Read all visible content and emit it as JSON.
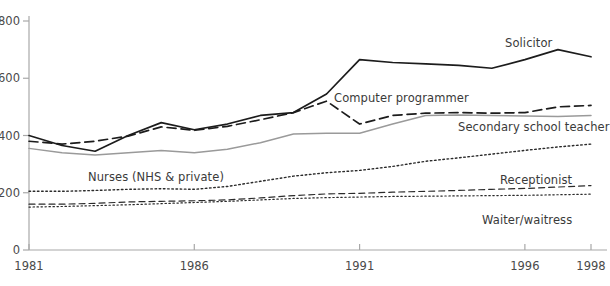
{
  "chart_data": {
    "type": "line",
    "title": "",
    "xlabel": "",
    "ylabel": "",
    "xlim": [
      1981,
      1998
    ],
    "ylim": [
      0,
      800
    ],
    "grid": false,
    "legend_position": "inline-labels",
    "x": [
      1981,
      1982,
      1983,
      1984,
      1985,
      1986,
      1987,
      1988,
      1989,
      1990,
      1991,
      1992,
      1993,
      1994,
      1995,
      1996,
      1997,
      1998
    ],
    "xticks": [
      1981,
      1986,
      1991,
      1996,
      1998
    ],
    "xtick_labels": [
      "1981",
      "1986",
      "1991",
      "1996",
      "1998"
    ],
    "yticks": [
      0,
      200,
      400,
      600,
      800
    ],
    "ytick_labels": [
      "0",
      "200",
      "400",
      "600",
      "800"
    ],
    "series": [
      {
        "name": "Solicitor",
        "style": "solid",
        "color": "#1c1c1c",
        "width": 1.7,
        "label_x": 505,
        "label_y": 36,
        "values": [
          400,
          365,
          345,
          400,
          445,
          420,
          440,
          470,
          480,
          545,
          665,
          655,
          650,
          645,
          635,
          665,
          700,
          675
        ]
      },
      {
        "name": "Computer programmer",
        "style": "dashed",
        "color": "#1c1c1c",
        "width": 1.7,
        "label_x": 334,
        "label_y": 91,
        "values": [
          380,
          370,
          380,
          398,
          430,
          418,
          432,
          455,
          480,
          520,
          440,
          470,
          478,
          480,
          478,
          480,
          500,
          505
        ]
      },
      {
        "name": "Secondary school teacher",
        "style": "solid",
        "color": "#9a9a9a",
        "width": 1.5,
        "label_x": 458,
        "label_y": 120,
        "values": [
          355,
          340,
          332,
          340,
          348,
          340,
          352,
          375,
          405,
          408,
          408,
          440,
          470,
          472,
          470,
          468,
          466,
          470
        ]
      },
      {
        "name": "Nurses (NHS & private)",
        "style": "dotted",
        "color": "#2b2b2b",
        "width": 1.4,
        "label_x": 88,
        "label_y": 170,
        "values": [
          205,
          205,
          208,
          212,
          214,
          212,
          222,
          240,
          258,
          270,
          278,
          292,
          310,
          322,
          335,
          348,
          360,
          370
        ]
      },
      {
        "name": "Receptionist",
        "style": "dashed",
        "color": "#2b2b2b",
        "width": 1.2,
        "label_x": 500,
        "label_y": 173,
        "values": [
          160,
          160,
          163,
          168,
          170,
          172,
          175,
          182,
          190,
          196,
          198,
          202,
          205,
          208,
          212,
          215,
          220,
          225
        ]
      },
      {
        "name": "Waiter/waitress",
        "style": "dotted",
        "color": "#2b2b2b",
        "width": 1.2,
        "label_x": 482,
        "label_y": 213,
        "values": [
          150,
          152,
          155,
          158,
          162,
          166,
          170,
          175,
          180,
          183,
          185,
          187,
          188,
          189,
          190,
          191,
          193,
          195
        ]
      }
    ]
  },
  "axis": {
    "axis_color": "#a8a8a8",
    "tick_color": "#a8a8a8",
    "label_color": "#4a4a4a"
  },
  "plot_geometry": {
    "left": 29,
    "right": 591,
    "top": 21,
    "bottom": 250
  }
}
